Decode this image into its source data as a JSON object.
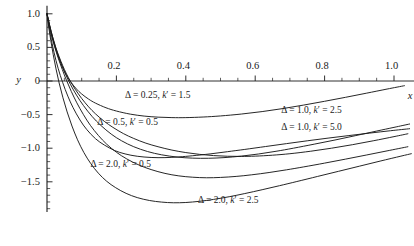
{
  "chart_data": {
    "type": "line",
    "title": "",
    "xlabel": "x",
    "ylabel": "y",
    "xlim": [
      -0.01,
      1.06
    ],
    "ylim": [
      -1.95,
      1.12
    ],
    "grid": false,
    "legend_position": "inline-annotations",
    "x_ticks": [
      {
        "value": 0.2,
        "label": "0.2"
      },
      {
        "value": 0.4,
        "label": "0.4"
      },
      {
        "value": 0.6,
        "label": "0.6"
      },
      {
        "value": 0.8,
        "label": "0.8"
      },
      {
        "value": 1.0,
        "label": "1.0"
      }
    ],
    "x_minor_ticks": [
      0.05,
      0.1,
      0.15,
      0.25,
      0.3,
      0.35,
      0.45,
      0.5,
      0.55,
      0.65,
      0.7,
      0.75,
      0.85,
      0.9,
      0.95
    ],
    "y_ticks": [
      {
        "value": 1.0,
        "label": "1.0"
      },
      {
        "value": 0.5,
        "label": "0.5"
      },
      {
        "value": 0.0,
        "label": "0"
      },
      {
        "value": -0.5,
        "label": "−0.5"
      },
      {
        "value": -1.0,
        "label": "−1.0"
      },
      {
        "value": -1.5,
        "label": "−1.5"
      }
    ],
    "y_minor_ticks": [
      0.9,
      0.8,
      0.7,
      0.6,
      0.4,
      0.3,
      0.2,
      0.1,
      -0.1,
      -0.2,
      -0.3,
      -0.4,
      -0.6,
      -0.7,
      -0.8,
      -0.9,
      -1.1,
      -1.2,
      -1.3,
      -1.4,
      -1.6,
      -1.7,
      -1.8,
      -1.9
    ],
    "series": [
      {
        "name": "Δ = 0.25, k′ = 1.5",
        "delta": 0.25,
        "k_prime": 1.5,
        "color": "#1a1a1a",
        "label_x": 0.225,
        "label_y": -0.22,
        "points": [
          [
            0.0,
            1.0
          ],
          [
            0.01,
            0.76
          ],
          [
            0.02,
            0.56
          ],
          [
            0.03,
            0.395
          ],
          [
            0.04,
            0.258
          ],
          [
            0.05,
            0.145
          ],
          [
            0.06,
            0.052
          ],
          [
            0.07,
            -0.025
          ],
          [
            0.085,
            -0.12
          ],
          [
            0.1,
            -0.193
          ],
          [
            0.12,
            -0.27
          ],
          [
            0.14,
            -0.33
          ],
          [
            0.17,
            -0.398
          ],
          [
            0.2,
            -0.447
          ],
          [
            0.24,
            -0.493
          ],
          [
            0.28,
            -0.522
          ],
          [
            0.32,
            -0.538
          ],
          [
            0.36,
            -0.545
          ],
          [
            0.4,
            -0.545
          ],
          [
            0.45,
            -0.536
          ],
          [
            0.5,
            -0.52
          ],
          [
            0.56,
            -0.492
          ],
          [
            0.62,
            -0.455
          ],
          [
            0.68,
            -0.41
          ],
          [
            0.74,
            -0.358
          ],
          [
            0.8,
            -0.302
          ],
          [
            0.86,
            -0.243
          ],
          [
            0.92,
            -0.182
          ],
          [
            0.98,
            -0.12
          ],
          [
            1.03,
            -0.07
          ]
        ]
      },
      {
        "name": "Δ = 0.5, k′ = 0.5",
        "delta": 0.5,
        "k_prime": 0.5,
        "color": "#1a1a1a",
        "label_x": 0.145,
        "label_y": -0.62,
        "points": [
          [
            0.0,
            1.0
          ],
          [
            0.008,
            0.82
          ],
          [
            0.016,
            0.66
          ],
          [
            0.025,
            0.505
          ],
          [
            0.035,
            0.36
          ],
          [
            0.045,
            0.232
          ],
          [
            0.055,
            0.118
          ],
          [
            0.068,
            -0.01
          ],
          [
            0.082,
            -0.128
          ],
          [
            0.1,
            -0.26
          ],
          [
            0.12,
            -0.385
          ],
          [
            0.14,
            -0.49
          ],
          [
            0.165,
            -0.6
          ],
          [
            0.19,
            -0.69
          ],
          [
            0.22,
            -0.782
          ],
          [
            0.25,
            -0.855
          ],
          [
            0.285,
            -0.925
          ],
          [
            0.32,
            -0.978
          ],
          [
            0.36,
            -1.028
          ],
          [
            0.4,
            -1.065
          ],
          [
            0.44,
            -1.092
          ],
          [
            0.48,
            -1.11
          ],
          [
            0.52,
            -1.12
          ],
          [
            0.56,
            -1.122
          ],
          [
            0.6,
            -1.118
          ],
          [
            0.65,
            -1.104
          ],
          [
            0.7,
            -1.082
          ],
          [
            0.76,
            -1.045
          ],
          [
            0.82,
            -1.0
          ],
          [
            0.88,
            -0.948
          ],
          [
            0.94,
            -0.89
          ],
          [
            1.0,
            -0.828
          ],
          [
            1.04,
            -0.785
          ]
        ]
      },
      {
        "name": "Δ = 1.0, k′ = 2.5",
        "delta": 1.0,
        "k_prime": 2.5,
        "color": "#1a1a1a",
        "label_x": 0.675,
        "label_y": -0.44,
        "points": [
          [
            0.0,
            1.0
          ],
          [
            0.012,
            0.735
          ],
          [
            0.024,
            0.51
          ],
          [
            0.038,
            0.3
          ],
          [
            0.052,
            0.118
          ],
          [
            0.068,
            -0.055
          ],
          [
            0.085,
            -0.21
          ],
          [
            0.105,
            -0.365
          ],
          [
            0.13,
            -0.528
          ],
          [
            0.155,
            -0.66
          ],
          [
            0.185,
            -0.79
          ],
          [
            0.215,
            -0.89
          ],
          [
            0.25,
            -0.978
          ],
          [
            0.29,
            -1.05
          ],
          [
            0.33,
            -1.098
          ],
          [
            0.375,
            -1.132
          ],
          [
            0.42,
            -1.148
          ],
          [
            0.465,
            -1.15
          ],
          [
            0.51,
            -1.14
          ],
          [
            0.56,
            -1.118
          ],
          [
            0.61,
            -1.086
          ],
          [
            0.66,
            -1.046
          ],
          [
            0.71,
            -1.0
          ],
          [
            0.77,
            -0.94
          ],
          [
            0.83,
            -0.878
          ],
          [
            0.89,
            -0.812
          ],
          [
            0.95,
            -0.745
          ],
          [
            1.0,
            -0.69
          ],
          [
            1.045,
            -0.64
          ]
        ]
      },
      {
        "name": "Δ = 1.0, k′ = 5.0",
        "delta": 1.0,
        "k_prime": 5.0,
        "color": "#1a1a1a",
        "label_x": 0.675,
        "label_y": -0.7,
        "points": [
          [
            0.0,
            1.0
          ],
          [
            0.01,
            0.69
          ],
          [
            0.02,
            0.43
          ],
          [
            0.032,
            0.19
          ],
          [
            0.045,
            -0.02
          ],
          [
            0.06,
            -0.225
          ],
          [
            0.075,
            -0.395
          ],
          [
            0.095,
            -0.58
          ],
          [
            0.115,
            -0.725
          ],
          [
            0.14,
            -0.86
          ],
          [
            0.165,
            -0.952
          ],
          [
            0.195,
            -1.035
          ],
          [
            0.225,
            -1.085
          ],
          [
            0.26,
            -1.12
          ],
          [
            0.3,
            -1.138
          ],
          [
            0.34,
            -1.14
          ],
          [
            0.38,
            -1.13
          ],
          [
            0.42,
            -1.112
          ],
          [
            0.47,
            -1.085
          ],
          [
            0.52,
            -1.052
          ],
          [
            0.57,
            -1.018
          ],
          [
            0.63,
            -0.975
          ],
          [
            0.69,
            -0.932
          ],
          [
            0.75,
            -0.89
          ],
          [
            0.81,
            -0.85
          ],
          [
            0.87,
            -0.812
          ],
          [
            0.93,
            -0.775
          ],
          [
            0.99,
            -0.74
          ],
          [
            1.045,
            -0.71
          ]
        ]
      },
      {
        "name": "Δ = 2.0, k′ = 0.5",
        "delta": 2.0,
        "k_prime": 0.5,
        "color": "#1a1a1a",
        "label_x": 0.125,
        "label_y": -1.25,
        "points": [
          [
            0.0,
            1.0
          ],
          [
            0.006,
            0.84
          ],
          [
            0.013,
            0.68
          ],
          [
            0.022,
            0.51
          ],
          [
            0.032,
            0.345
          ],
          [
            0.044,
            0.172
          ],
          [
            0.056,
            0.012
          ],
          [
            0.07,
            -0.155
          ],
          [
            0.086,
            -0.325
          ],
          [
            0.105,
            -0.5
          ],
          [
            0.125,
            -0.66
          ],
          [
            0.148,
            -0.81
          ],
          [
            0.172,
            -0.94
          ],
          [
            0.2,
            -1.06
          ],
          [
            0.23,
            -1.16
          ],
          [
            0.265,
            -1.25
          ],
          [
            0.3,
            -1.318
          ],
          [
            0.34,
            -1.375
          ],
          [
            0.38,
            -1.412
          ],
          [
            0.42,
            -1.432
          ],
          [
            0.46,
            -1.44
          ],
          [
            0.5,
            -1.435
          ],
          [
            0.545,
            -1.42
          ],
          [
            0.59,
            -1.396
          ],
          [
            0.64,
            -1.362
          ],
          [
            0.69,
            -1.322
          ],
          [
            0.74,
            -1.278
          ],
          [
            0.8,
            -1.222
          ],
          [
            0.86,
            -1.163
          ],
          [
            0.92,
            -1.102
          ],
          [
            0.98,
            -1.04
          ],
          [
            1.04,
            -0.978
          ]
        ]
      },
      {
        "name": "Δ = 2.0, k′ = 2.5",
        "delta": 2.0,
        "k_prime": 2.5,
        "color": "#1a1a1a",
        "label_x": 0.435,
        "label_y": -1.78,
        "points": [
          [
            0.0,
            1.0
          ],
          [
            0.005,
            0.8
          ],
          [
            0.011,
            0.6
          ],
          [
            0.018,
            0.39
          ],
          [
            0.026,
            0.18
          ],
          [
            0.035,
            -0.03
          ],
          [
            0.046,
            -0.25
          ],
          [
            0.058,
            -0.46
          ],
          [
            0.072,
            -0.67
          ],
          [
            0.088,
            -0.875
          ],
          [
            0.106,
            -1.062
          ],
          [
            0.126,
            -1.228
          ],
          [
            0.148,
            -1.372
          ],
          [
            0.172,
            -1.492
          ],
          [
            0.198,
            -1.588
          ],
          [
            0.228,
            -1.672
          ],
          [
            0.26,
            -1.735
          ],
          [
            0.295,
            -1.778
          ],
          [
            0.33,
            -1.802
          ],
          [
            0.365,
            -1.812
          ],
          [
            0.4,
            -1.808
          ],
          [
            0.44,
            -1.79
          ],
          [
            0.48,
            -1.762
          ],
          [
            0.525,
            -1.722
          ],
          [
            0.57,
            -1.675
          ],
          [
            0.62,
            -1.618
          ],
          [
            0.67,
            -1.558
          ],
          [
            0.72,
            -1.496
          ],
          [
            0.78,
            -1.42
          ],
          [
            0.84,
            -1.344
          ],
          [
            0.9,
            -1.268
          ],
          [
            0.96,
            -1.192
          ],
          [
            1.02,
            -1.118
          ],
          [
            1.05,
            -1.082
          ]
        ]
      }
    ]
  }
}
